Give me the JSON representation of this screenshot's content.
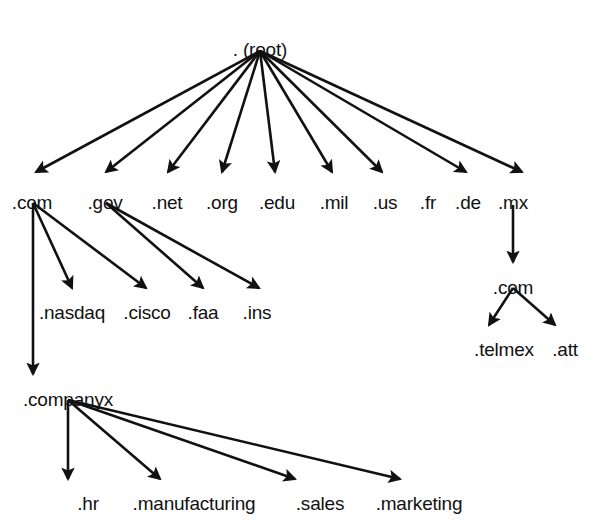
{
  "diagram": {
    "type": "tree",
    "background_color": "#ffffff",
    "line_color": "#111111",
    "text_color": "#111111",
    "nodes": [
      {
        "id": "root",
        "label": ". (root)",
        "x": 260,
        "y": 40,
        "level": "root"
      },
      {
        "id": "com",
        "label": ".com",
        "x": 32,
        "y": 193,
        "level": "tld"
      },
      {
        "id": "gov",
        "label": ".gov",
        "x": 105,
        "y": 193,
        "level": "tld"
      },
      {
        "id": "net",
        "label": ".net",
        "x": 167,
        "y": 193,
        "level": "tld"
      },
      {
        "id": "org",
        "label": ".org",
        "x": 222,
        "y": 193,
        "level": "tld"
      },
      {
        "id": "edu",
        "label": ".edu",
        "x": 277,
        "y": 193,
        "level": "tld"
      },
      {
        "id": "mil",
        "label": ".mil",
        "x": 334,
        "y": 193,
        "level": "tld"
      },
      {
        "id": "us",
        "label": ".us",
        "x": 385,
        "y": 193,
        "level": "tld"
      },
      {
        "id": "fr",
        "label": ".fr",
        "x": 428,
        "y": 193,
        "level": "tld"
      },
      {
        "id": "de",
        "label": ".de",
        "x": 468,
        "y": 193,
        "level": "tld"
      },
      {
        "id": "mx",
        "label": ".mx",
        "x": 513,
        "y": 193,
        "level": "tld"
      },
      {
        "id": "nasdaq",
        "label": ".nasdaq",
        "x": 72,
        "y": 303,
        "level": "sld"
      },
      {
        "id": "cisco",
        "label": ".cisco",
        "x": 147,
        "y": 303,
        "level": "sld"
      },
      {
        "id": "faa",
        "label": ".faa",
        "x": 203,
        "y": 303,
        "level": "sld"
      },
      {
        "id": "ins",
        "label": ".ins",
        "x": 257,
        "y": 303,
        "level": "sld"
      },
      {
        "id": "mx-com",
        "label": ".com",
        "x": 513,
        "y": 278,
        "level": "sld"
      },
      {
        "id": "telmex",
        "label": ".telmex",
        "x": 504,
        "y": 340,
        "level": "dept"
      },
      {
        "id": "att",
        "label": ".att",
        "x": 565,
        "y": 340,
        "level": "dept"
      },
      {
        "id": "companyx",
        "label": ".companyx",
        "x": 68,
        "y": 390,
        "level": "sld"
      },
      {
        "id": "hr",
        "label": ".hr",
        "x": 88,
        "y": 494,
        "level": "dept"
      },
      {
        "id": "manufacturing",
        "label": ".manufacturing",
        "x": 194,
        "y": 494,
        "level": "dept"
      },
      {
        "id": "sales",
        "label": ".sales",
        "x": 320,
        "y": 494,
        "level": "dept"
      },
      {
        "id": "marketing",
        "label": ".marketing",
        "x": 419,
        "y": 494,
        "level": "dept"
      }
    ],
    "edges": [
      {
        "id": "root-com",
        "from": "root",
        "to": "com",
        "x1": 260,
        "y1": 51,
        "x2": 36,
        "y2": 172,
        "arrow": true
      },
      {
        "id": "root-gov",
        "from": "root",
        "to": "gov",
        "x1": 260,
        "y1": 51,
        "x2": 106,
        "y2": 172,
        "arrow": true
      },
      {
        "id": "root-net",
        "from": "root",
        "to": "net",
        "x1": 260,
        "y1": 51,
        "x2": 168,
        "y2": 172,
        "arrow": true
      },
      {
        "id": "root-org",
        "from": "root",
        "to": "org",
        "x1": 260,
        "y1": 51,
        "x2": 222,
        "y2": 172,
        "arrow": true
      },
      {
        "id": "root-edu",
        "from": "root",
        "to": "edu",
        "x1": 260,
        "y1": 51,
        "x2": 275,
        "y2": 172,
        "arrow": true
      },
      {
        "id": "root-mil",
        "from": "root",
        "to": "mil",
        "x1": 260,
        "y1": 51,
        "x2": 332,
        "y2": 172,
        "arrow": true
      },
      {
        "id": "root-us",
        "from": "root",
        "to": "us",
        "x1": 260,
        "y1": 51,
        "x2": 382,
        "y2": 172,
        "arrow": true
      },
      {
        "id": "root-de",
        "from": "root",
        "to": "de",
        "x1": 260,
        "y1": 51,
        "x2": 466,
        "y2": 172,
        "arrow": true
      },
      {
        "id": "root-mx",
        "from": "root",
        "to": "mx",
        "x1": 260,
        "y1": 51,
        "x2": 522,
        "y2": 172,
        "arrow": true
      },
      {
        "id": "com-nasdaq",
        "from": "com",
        "to": "nasdaq",
        "x1": 33,
        "y1": 203,
        "x2": 72,
        "y2": 288,
        "arrow": true
      },
      {
        "id": "com-cisco",
        "from": "com",
        "to": "cisco",
        "x1": 33,
        "y1": 203,
        "x2": 146,
        "y2": 288,
        "arrow": true
      },
      {
        "id": "com-companyx",
        "from": "com",
        "to": "companyx",
        "x1": 33,
        "y1": 203,
        "x2": 33,
        "y2": 374,
        "arrow": true
      },
      {
        "id": "gov-faa",
        "from": "gov",
        "to": "faa",
        "x1": 106,
        "y1": 203,
        "x2": 203,
        "y2": 288,
        "arrow": true
      },
      {
        "id": "gov-ins",
        "from": "gov",
        "to": "ins",
        "x1": 106,
        "y1": 203,
        "x2": 259,
        "y2": 288,
        "arrow": true
      },
      {
        "id": "mx-mxcom",
        "from": "mx",
        "to": "mx-com",
        "x1": 513,
        "y1": 205,
        "x2": 513,
        "y2": 262,
        "arrow": true
      },
      {
        "id": "mxcom-telmex",
        "from": "mx-com",
        "to": "telmex",
        "x1": 513,
        "y1": 288,
        "x2": 489,
        "y2": 325,
        "arrow": true
      },
      {
        "id": "mxcom-att",
        "from": "mx-com",
        "to": "att",
        "x1": 513,
        "y1": 288,
        "x2": 555,
        "y2": 325,
        "arrow": true
      },
      {
        "id": "companyx-hr",
        "from": "companyx",
        "to": "hr",
        "x1": 68,
        "y1": 400,
        "x2": 68,
        "y2": 479,
        "arrow": true
      },
      {
        "id": "companyx-manufacturing",
        "from": "companyx",
        "to": "manufacturing",
        "x1": 68,
        "y1": 400,
        "x2": 160,
        "y2": 479,
        "arrow": true
      },
      {
        "id": "companyx-sales",
        "from": "companyx",
        "to": "sales",
        "x1": 68,
        "y1": 400,
        "x2": 295,
        "y2": 479,
        "arrow": true
      },
      {
        "id": "companyx-marketing",
        "from": "companyx",
        "to": "marketing",
        "x1": 68,
        "y1": 400,
        "x2": 400,
        "y2": 479,
        "arrow": true
      }
    ]
  }
}
